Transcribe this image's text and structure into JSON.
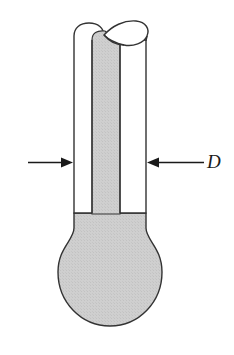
{
  "figure": {
    "kind": "technical-line-drawing",
    "background_color": "#ffffff",
    "outline_color": "#333333",
    "fill_color": "#cccccc",
    "outline_width": 1.4
  },
  "labels": {
    "diameter": {
      "text": "D",
      "style": "italic-serif",
      "x": 207,
      "y": 153,
      "font_size": 19,
      "color": "#1a1a1a"
    }
  },
  "annotations": {
    "left_arrow": {
      "name": "left-dimension-arrow",
      "direction": "right",
      "tail_x": 28,
      "tip_x": 73,
      "y": 162,
      "color": "#1a1a1a"
    },
    "right_arrow": {
      "name": "right-dimension-arrow",
      "direction": "left",
      "tail_x": 200,
      "tip_x": 147,
      "y": 162,
      "color": "#1a1a1a"
    },
    "leader_line": {
      "name": "diameter-leader-line",
      "from_x": 200,
      "to_x": 205,
      "y": 162
    }
  },
  "geometry": {
    "tube": {
      "outer_left_x": 74,
      "outer_right_x": 146,
      "top_y": 28,
      "bottom_y": 213,
      "wall_inner_left_x": 92,
      "wall_inner_right_x": 120
    },
    "rim": {
      "ellipse_center_x": 124,
      "ellipse_center_y": 34,
      "ellipse_rx": 22,
      "ellipse_ry": 12
    },
    "bulb": {
      "center_x": 110,
      "center_y": 272,
      "radius_x": 52,
      "radius_y": 54,
      "top_y": 213,
      "bottom_y": 326,
      "left_x": 58,
      "right_x": 162
    },
    "inner_column": {
      "left_x": 92,
      "right_x": 120,
      "top_y": 31,
      "bottom_y": 213
    }
  }
}
